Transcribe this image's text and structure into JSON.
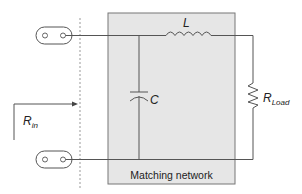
{
  "diagram": {
    "type": "circuit-schematic",
    "box_label": "Matching network",
    "labels": {
      "inductor": "L",
      "capacitor": "C",
      "load_main": "R",
      "load_sub": "Load",
      "input_main": "R",
      "input_sub": "in"
    },
    "components": [
      {
        "id": "L",
        "kind": "inductor",
        "position": "series, top rail"
      },
      {
        "id": "C",
        "kind": "capacitor",
        "position": "shunt, input side"
      },
      {
        "id": "RLoad",
        "kind": "resistor",
        "position": "load, outside box"
      }
    ],
    "ports": [
      {
        "id": "port-top",
        "kind": "connector"
      },
      {
        "id": "port-bottom",
        "kind": "connector"
      }
    ],
    "colors": {
      "wire": "#555555",
      "box_fill": "#e6e6e6",
      "box_stroke": "#777777",
      "dashed_line": "#999999"
    }
  }
}
